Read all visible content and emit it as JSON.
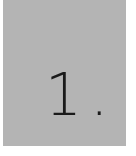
{
  "card": {
    "label": "1.",
    "background_color": "#b4b4b4",
    "text_color": "#1a1a1a"
  }
}
